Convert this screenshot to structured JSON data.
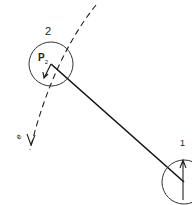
{
  "diagram": {
    "type": "two-body linkage sketch",
    "nodes": [
      {
        "id": "2",
        "label": "2",
        "point_label": "P",
        "point_subscript": "2"
      },
      {
        "id": "1",
        "label": "1"
      }
    ],
    "edges": [
      {
        "from": "2",
        "to": "1",
        "style": "solid"
      }
    ],
    "path": {
      "style": "dashed",
      "label": "e",
      "arrow": "down"
    },
    "colors": {
      "stroke": "#222222",
      "background": "#ffffff"
    }
  },
  "labels": {
    "node2": "2",
    "node1": "1",
    "p_main": "P",
    "p_sub": "2",
    "path_label": "e"
  }
}
